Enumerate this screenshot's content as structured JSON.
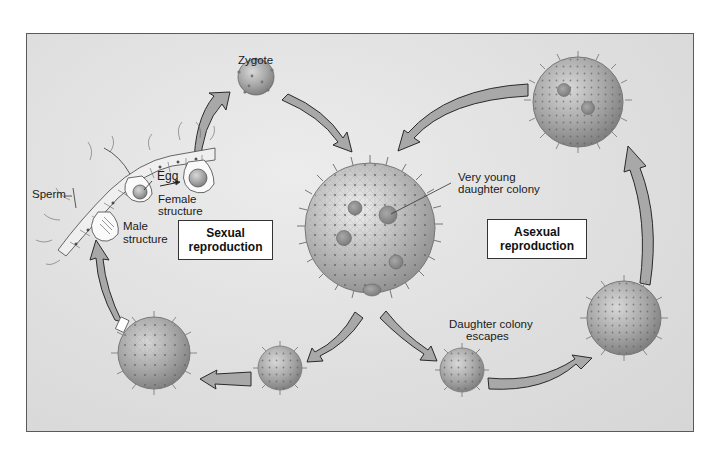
{
  "diagram": {
    "title_boxes": {
      "sexual": {
        "line1": "Sexual",
        "line2": "reproduction"
      },
      "asexual": {
        "line1": "Asexual",
        "line2": "reproduction"
      }
    },
    "labels": {
      "zygote": "Zygote",
      "egg": "Egg",
      "sperm": "Sperm",
      "female_structure_1": "Female",
      "female_structure_2": "structure",
      "male_structure_1": "Male",
      "male_structure_2": "structure",
      "very_young_1": "Very young",
      "very_young_2": "daughter colony",
      "daughter_escapes_1": "Daughter colony",
      "daughter_escapes_2": "escapes"
    },
    "colors": {
      "background": "#dedede",
      "frame_border": "#5a5a5a",
      "arrow_fill": "#a8a8a8",
      "arrow_stroke": "#2a2a2a",
      "colony_fill": "#b5b5b5",
      "box_fill": "#ffffff"
    },
    "nodes": [
      {
        "id": "zygote",
        "cx": 256,
        "cy": 77,
        "r": 18
      },
      {
        "id": "parent-colony",
        "cx": 370,
        "cy": 228,
        "r": 65
      },
      {
        "id": "asexual-mature-colony",
        "cx": 578,
        "cy": 102,
        "r": 45
      },
      {
        "id": "asexual-growing-colony",
        "cx": 624,
        "cy": 318,
        "r": 37
      },
      {
        "id": "escaped-daughter-colony",
        "cx": 462,
        "cy": 370,
        "r": 22
      },
      {
        "id": "sexual-young-colony",
        "cx": 280,
        "cy": 368,
        "r": 22
      },
      {
        "id": "sexual-mature-colony",
        "cx": 154,
        "cy": 353,
        "r": 36
      }
    ]
  }
}
